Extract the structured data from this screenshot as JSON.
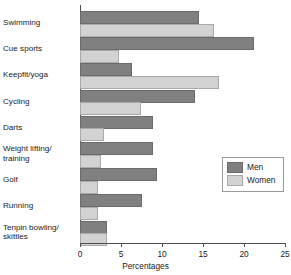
{
  "chart_data": {
    "type": "bar",
    "orientation": "horizontal",
    "title": "",
    "xlabel": "Percentages",
    "ylabel": "",
    "xlim": [
      0,
      25
    ],
    "xticks": [
      0,
      5,
      10,
      15,
      20,
      25
    ],
    "grid": false,
    "legend_position": "center-right",
    "categories": [
      "Swimming",
      "Cue sports",
      "Keepfit/yoga",
      "Cycling",
      "Darts",
      "Weight lifting/\ntraining",
      "Golf",
      "Running",
      "Tenpin bowling/\nskittles"
    ],
    "series": [
      {
        "name": "Men",
        "color": "#808080",
        "values": [
          14.3,
          21.0,
          6.1,
          13.8,
          8.7,
          8.6,
          9.1,
          7.3,
          3.1
        ]
      },
      {
        "name": "Women",
        "color": "#d2d2d2",
        "values": [
          16.1,
          4.5,
          16.7,
          7.2,
          2.7,
          2.3,
          1.9,
          2.0,
          3.1
        ]
      }
    ]
  },
  "legend": {
    "entries": [
      {
        "label": "Men"
      },
      {
        "label": "Women"
      }
    ]
  },
  "axis": {
    "x_tick_labels": [
      "0",
      "5",
      "10",
      "15",
      "20",
      "25"
    ],
    "x_axis_title": "Percentages"
  }
}
